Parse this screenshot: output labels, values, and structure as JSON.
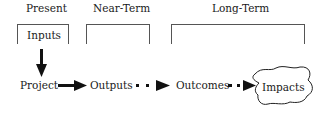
{
  "diagram": {
    "phases": [
      {
        "label": "Present"
      },
      {
        "label": "Near-Term"
      },
      {
        "label": "Long-Term"
      }
    ],
    "input_box": {
      "label": "Inputs"
    },
    "flow": [
      {
        "label": "Project"
      },
      {
        "label": "Outputs"
      },
      {
        "label": "Outcomes"
      },
      {
        "label": "Impacts"
      }
    ],
    "connectors": [
      {
        "from": "Inputs",
        "to": "Project",
        "style": "solid-arrow"
      },
      {
        "from": "Project",
        "to": "Outputs",
        "style": "solid-arrow"
      },
      {
        "from": "Outputs",
        "to": "Outcomes",
        "style": "dotted-arrow"
      },
      {
        "from": "Outcomes",
        "to": "Impacts",
        "style": "dotted-arrow"
      }
    ],
    "colors": {
      "line": "#555555",
      "text": "#1a1a1a",
      "arrow": "#111111"
    }
  }
}
